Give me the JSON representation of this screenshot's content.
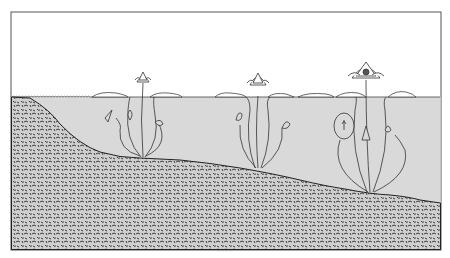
{
  "illustration": {
    "subject": "water lilies growing in a pond at different depths",
    "colors": {
      "background": "#ffffff",
      "frame": "#555555",
      "water": "#d9d9d9",
      "soil_base": "#c8c8c8",
      "soil_texture": "#333333",
      "outline": "#333333"
    },
    "plants": [
      {
        "name": "shallow-plant",
        "x": 143,
        "flower_y": 75
      },
      {
        "name": "middle-plant",
        "x": 258,
        "flower_y": 78
      },
      {
        "name": "deep-plant",
        "x": 370,
        "flower_y": 73
      }
    ]
  },
  "caption": {
    "text": "· · · ·"
  }
}
